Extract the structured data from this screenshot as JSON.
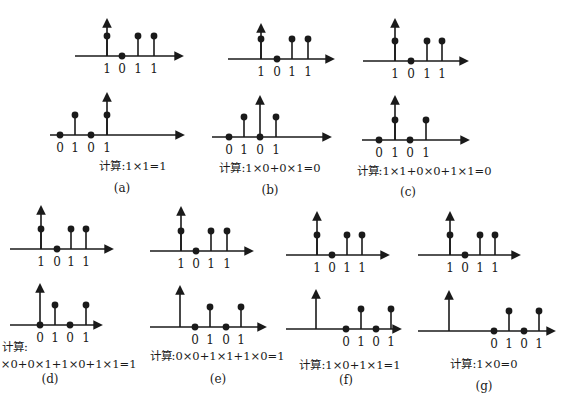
{
  "figure": {
    "stroke_color": "#1a1a1a",
    "background": "#ffffff"
  },
  "panels": [
    {
      "id": "a",
      "caption": "(a)",
      "calc": "计算:1×1=1",
      "calc_pos": [
        133,
        170
      ],
      "caption_pos": [
        122,
        192
      ],
      "top": {
        "axis_y": 56,
        "x_start": 75,
        "x_end": 182,
        "origin_x": 107,
        "arrow_top": 20,
        "stems": [
          {
            "x": 107,
            "v": 1,
            "label": "1"
          },
          {
            "x": 122,
            "v": 0,
            "label": "0"
          },
          {
            "x": 138,
            "v": 1,
            "label": "1"
          },
          {
            "x": 154,
            "v": 1,
            "label": "1"
          }
        ]
      },
      "bottom": {
        "axis_y": 135,
        "x_start": 50,
        "x_end": 183,
        "origin_x": 107,
        "arrow_top": 94,
        "stems": [
          {
            "x": 60,
            "v": 0,
            "label": "0"
          },
          {
            "x": 75,
            "v": 1,
            "label": "1"
          },
          {
            "x": 91,
            "v": 0,
            "label": "0"
          },
          {
            "x": 107,
            "v": 1,
            "label": "1"
          }
        ]
      }
    },
    {
      "id": "b",
      "caption": "(b)",
      "calc": "计算:1×0+0×1=0",
      "calc_pos": [
        270,
        172
      ],
      "caption_pos": [
        270,
        194
      ],
      "top": {
        "axis_y": 59,
        "x_start": 228,
        "x_end": 333,
        "origin_x": 261,
        "arrow_top": 25,
        "stems": [
          {
            "x": 261,
            "v": 1,
            "label": "1"
          },
          {
            "x": 277,
            "v": 0,
            "label": "0"
          },
          {
            "x": 292,
            "v": 1,
            "label": "1"
          },
          {
            "x": 308,
            "v": 1,
            "label": "1"
          }
        ]
      },
      "bottom": {
        "axis_y": 137,
        "x_start": 212,
        "x_end": 330,
        "origin_x": 260,
        "arrow_top": 97,
        "stems": [
          {
            "x": 229,
            "v": 0,
            "label": "0"
          },
          {
            "x": 244,
            "v": 1,
            "label": "1"
          },
          {
            "x": 260,
            "v": 0,
            "label": "0"
          },
          {
            "x": 276,
            "v": 1,
            "label": "1"
          }
        ]
      }
    },
    {
      "id": "c",
      "caption": "(c)",
      "calc": "计算:1×1+0×0+1×1=0",
      "calc_pos": [
        424,
        175
      ],
      "caption_pos": [
        408,
        196
      ],
      "top": {
        "axis_y": 61,
        "x_start": 363,
        "x_end": 467,
        "origin_x": 395,
        "arrow_top": 20,
        "stems": [
          {
            "x": 395,
            "v": 1,
            "label": "1"
          },
          {
            "x": 411,
            "v": 0,
            "label": "0"
          },
          {
            "x": 427,
            "v": 1,
            "label": "1"
          },
          {
            "x": 442,
            "v": 1,
            "label": "1"
          }
        ]
      },
      "bottom": {
        "axis_y": 140,
        "x_start": 362,
        "x_end": 468,
        "origin_x": 395,
        "arrow_top": 97,
        "stems": [
          {
            "x": 379,
            "v": 0,
            "label": "0"
          },
          {
            "x": 395,
            "v": 1,
            "label": "1"
          },
          {
            "x": 410,
            "v": 0,
            "label": "0"
          },
          {
            "x": 426,
            "v": 1,
            "label": "1"
          }
        ]
      }
    },
    {
      "id": "d",
      "caption": "(d)",
      "calc_line1": "计算:",
      "calc": "1×0+0×1+1×0+1×1=1",
      "calc_line1_pos": [
        2,
        351
      ],
      "calc_pos": [
        65,
        368
      ],
      "caption_pos": [
        50,
        383
      ],
      "top": {
        "axis_y": 249,
        "x_start": 10,
        "x_end": 112,
        "origin_x": 41,
        "arrow_top": 207,
        "stems": [
          {
            "x": 41,
            "v": 1,
            "label": "1"
          },
          {
            "x": 57,
            "v": 0,
            "label": "0"
          },
          {
            "x": 71,
            "v": 1,
            "label": "1"
          },
          {
            "x": 86,
            "v": 1,
            "label": "1"
          }
        ]
      },
      "bottom": {
        "axis_y": 325,
        "x_start": 10,
        "x_end": 101,
        "origin_x": 40,
        "arrow_top": 285,
        "stems": [
          {
            "x": 40,
            "v": 0,
            "label": "0"
          },
          {
            "x": 55,
            "v": 1,
            "label": "1"
          },
          {
            "x": 70,
            "v": 0,
            "label": "0"
          },
          {
            "x": 86,
            "v": 1,
            "label": "1"
          }
        ]
      }
    },
    {
      "id": "e",
      "caption": "(e)",
      "calc": "计算:0×0+1×1+1×0=1",
      "calc_pos": [
        217,
        360
      ],
      "caption_pos": [
        218,
        383
      ],
      "top": {
        "axis_y": 251,
        "x_start": 150,
        "x_end": 252,
        "origin_x": 181,
        "arrow_top": 208,
        "stems": [
          {
            "x": 181,
            "v": 1,
            "label": "1"
          },
          {
            "x": 196,
            "v": 0,
            "label": "0"
          },
          {
            "x": 211,
            "v": 1,
            "label": "1"
          },
          {
            "x": 227,
            "v": 1,
            "label": "1"
          }
        ]
      },
      "bottom": {
        "axis_y": 327,
        "x_start": 150,
        "x_end": 265,
        "origin_x": 180,
        "arrow_top": 287,
        "stems": [
          {
            "x": 195,
            "v": 0,
            "label": "0"
          },
          {
            "x": 210,
            "v": 1,
            "label": "1"
          },
          {
            "x": 226,
            "v": 0,
            "label": "0"
          },
          {
            "x": 241,
            "v": 1,
            "label": "1"
          }
        ]
      }
    },
    {
      "id": "f",
      "caption": "(f)",
      "calc": "计算:1×0+1×1=1",
      "calc_pos": [
        350,
        369
      ],
      "caption_pos": [
        346,
        384
      ],
      "top": {
        "axis_y": 255,
        "x_start": 286,
        "x_end": 388,
        "origin_x": 317,
        "arrow_top": 213,
        "stems": [
          {
            "x": 317,
            "v": 1,
            "label": "1"
          },
          {
            "x": 332,
            "v": 0,
            "label": "0"
          },
          {
            "x": 347,
            "v": 1,
            "label": "1"
          },
          {
            "x": 362,
            "v": 1,
            "label": "1"
          }
        ]
      },
      "bottom": {
        "axis_y": 329,
        "x_start": 286,
        "x_end": 400,
        "origin_x": 316,
        "arrow_top": 291,
        "stems": [
          {
            "x": 346,
            "v": 0,
            "label": "0"
          },
          {
            "x": 361,
            "v": 1,
            "label": "1"
          },
          {
            "x": 376,
            "v": 0,
            "label": "0"
          },
          {
            "x": 391,
            "v": 1,
            "label": "1"
          }
        ]
      }
    },
    {
      "id": "g",
      "caption": "(g)",
      "calc": "计算:1×0=0",
      "calc_pos": [
        484,
        368
      ],
      "caption_pos": [
        484,
        390
      ],
      "top": {
        "axis_y": 255,
        "x_start": 418,
        "x_end": 519,
        "origin_x": 450,
        "arrow_top": 213,
        "stems": [
          {
            "x": 450,
            "v": 1,
            "label": "1"
          },
          {
            "x": 465,
            "v": 0,
            "label": "0"
          },
          {
            "x": 480,
            "v": 1,
            "label": "1"
          },
          {
            "x": 495,
            "v": 1,
            "label": "1"
          }
        ]
      },
      "bottom": {
        "axis_y": 331,
        "x_start": 418,
        "x_end": 554,
        "origin_x": 449,
        "arrow_top": 292,
        "stems": [
          {
            "x": 494,
            "v": 0,
            "label": "0"
          },
          {
            "x": 509,
            "v": 1,
            "label": "1"
          },
          {
            "x": 524,
            "v": 0,
            "label": "0"
          },
          {
            "x": 539,
            "v": 1,
            "label": "1"
          }
        ]
      }
    }
  ]
}
